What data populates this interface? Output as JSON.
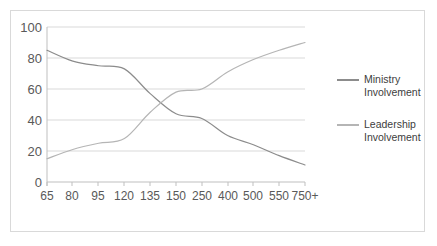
{
  "chart_data": {
    "type": "line",
    "title": "",
    "xlabel": "",
    "ylabel": "",
    "categories": [
      "65",
      "80",
      "95",
      "120",
      "135",
      "150",
      "250",
      "400",
      "500",
      "550",
      "750+"
    ],
    "ylim": [
      0,
      100
    ],
    "y_ticks": [
      "0",
      "20",
      "40",
      "60",
      "80",
      "100"
    ],
    "grid": "horizontal",
    "legend_position": "right",
    "smoothed": true,
    "series": [
      {
        "name": "Ministry Involvement",
        "color": "#8c8c8c",
        "values": [
          85,
          78,
          75,
          73,
          57,
          44,
          41,
          30,
          24,
          17,
          11
        ]
      },
      {
        "name": "Leadership Involvement",
        "color": "#b5b5b5",
        "values": [
          15,
          21,
          25,
          28,
          45,
          58,
          60,
          71,
          79,
          85,
          90
        ]
      }
    ]
  },
  "legend": {
    "items": [
      {
        "line1": "Ministry",
        "line2": "Involvement"
      },
      {
        "line1": "Leadership",
        "line2": "Involvement"
      }
    ]
  },
  "axis": {
    "y_labels": [
      "100",
      "80",
      "60",
      "40",
      "20",
      "0"
    ],
    "x_labels": [
      "65",
      "80",
      "95",
      "120",
      "135",
      "150",
      "250",
      "400",
      "500",
      "550",
      "750+"
    ]
  },
  "colors": {
    "series1": "#8c8c8c",
    "series2": "#b5b5b5",
    "grid": "#d9d9d9",
    "axis": "#d9d9d9",
    "text": "#595959",
    "frame": "#d9d9d9"
  }
}
